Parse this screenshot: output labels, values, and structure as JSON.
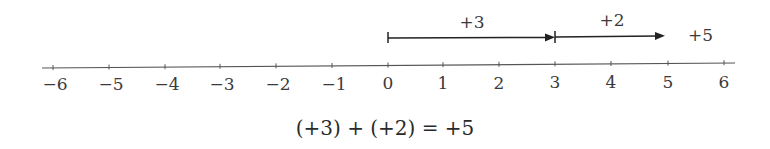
{
  "diagram": {
    "axis": {
      "ticks": [
        "−6",
        "−5",
        "−4",
        "−3",
        "−2",
        "−1",
        "0",
        "1",
        "2",
        "3",
        "4",
        "5",
        "6"
      ],
      "values": [
        -6,
        -5,
        -4,
        -3,
        -2,
        -1,
        0,
        1,
        2,
        3,
        4,
        5,
        6
      ]
    },
    "arrows": [
      {
        "label": "+3",
        "from": 0,
        "to": 3
      },
      {
        "label": "+2",
        "from": 3,
        "to": 5
      }
    ],
    "result_label": "+5",
    "equation": "(+3) + (+2) = +5"
  }
}
